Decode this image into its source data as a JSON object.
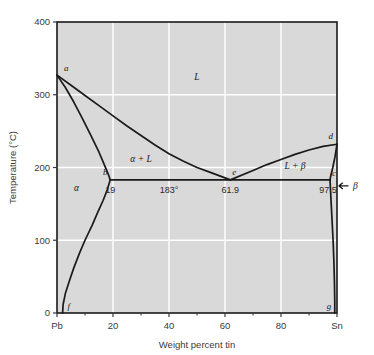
{
  "figure": {
    "background_color": "#d9d9d9",
    "gridline_color": "#ffffff",
    "line_color": "#1a1a1a",
    "frame_color": "#1a1a1a"
  },
  "axes": {
    "x_title": "Weight percent tin",
    "y_title": "Temperature (°C)",
    "x_ticks": [
      "Pb",
      "20",
      "40",
      "60",
      "80",
      "Sn"
    ],
    "x_tick_values": [
      0,
      20,
      40,
      60,
      80,
      100
    ],
    "x_minor_values": [
      10,
      30,
      50,
      70,
      90
    ],
    "y_ticks": [
      "0",
      "100",
      "200",
      "300",
      "400"
    ],
    "y_tick_values": [
      0,
      100,
      200,
      300,
      400
    ],
    "xlim": [
      0,
      100
    ],
    "ylim": [
      0,
      400
    ]
  },
  "point_labels": {
    "a": "a",
    "b": "b",
    "c": "c",
    "d": "d",
    "e": "e",
    "f": "f",
    "g": "g"
  },
  "region_labels": {
    "liquid": "L",
    "alpha": "α",
    "beta": "β",
    "alpha_plus_liquid": "α + L",
    "liquid_plus_beta": "L + β"
  },
  "value_labels": {
    "alpha_max": "19",
    "eutectic_temp": "183°",
    "eutectic_comp": "61.9",
    "beta_min": "97.5"
  },
  "chart_data": {
    "type": "line",
    "xlabel": "Weight percent tin",
    "ylabel": "Temperature (°C)",
    "xlim": [
      0,
      100
    ],
    "ylim": [
      0,
      400
    ],
    "grid": true,
    "legend": "none",
    "annotations": [
      {
        "label": "a",
        "x": 0,
        "y": 327,
        "note": "melting point of pure Pb"
      },
      {
        "label": "b",
        "x": 19,
        "y": 183,
        "note": "maximum solubility of Sn in alpha"
      },
      {
        "label": "c",
        "x": 97.5,
        "y": 183,
        "note": "maximum solubility of Pb in beta"
      },
      {
        "label": "d",
        "x": 100,
        "y": 232,
        "note": "melting point of pure Sn"
      },
      {
        "label": "e",
        "x": 61.9,
        "y": 183,
        "note": "eutectic point"
      },
      {
        "label": "f",
        "x": 2,
        "y": 0,
        "note": "solvus terminus on Pb side"
      },
      {
        "label": "g",
        "x": 99,
        "y": 0,
        "note": "solvus terminus on Sn side"
      },
      {
        "label": "19",
        "x": 19,
        "y": 170,
        "note": "composition value"
      },
      {
        "label": "183°",
        "x": 40,
        "y": 170,
        "note": "eutectic temperature"
      },
      {
        "label": "61.9",
        "x": 61.9,
        "y": 170,
        "note": "eutectic composition"
      },
      {
        "label": "97.5",
        "x": 97.5,
        "y": 170,
        "note": "composition value"
      }
    ],
    "series": [
      {
        "name": "liquidus (Pb side) a-e",
        "values": [
          [
            0,
            327
          ],
          [
            5,
            313
          ],
          [
            10,
            299
          ],
          [
            15,
            285
          ],
          [
            20,
            271
          ],
          [
            25,
            257
          ],
          [
            30,
            244
          ],
          [
            35,
            231
          ],
          [
            40,
            219
          ],
          [
            45,
            209
          ],
          [
            50,
            200
          ],
          [
            55,
            193
          ],
          [
            61.9,
            183
          ]
        ]
      },
      {
        "name": "liquidus (Sn side) e-d",
        "values": [
          [
            61.9,
            183
          ],
          [
            70,
            196
          ],
          [
            75,
            204
          ],
          [
            80,
            211
          ],
          [
            85,
            218
          ],
          [
            90,
            224
          ],
          [
            95,
            229
          ],
          [
            100,
            232
          ]
        ]
      },
      {
        "name": "solidus (Pb side) a-b",
        "values": [
          [
            0,
            327
          ],
          [
            3,
            310
          ],
          [
            6,
            290
          ],
          [
            9,
            268
          ],
          [
            12,
            245
          ],
          [
            15,
            221
          ],
          [
            17,
            203
          ],
          [
            18.3,
            191
          ],
          [
            19,
            183
          ]
        ]
      },
      {
        "name": "solidus (Sn side) d-c",
        "values": [
          [
            100,
            232
          ],
          [
            99.3,
            215
          ],
          [
            98.5,
            200
          ],
          [
            97.8,
            189
          ],
          [
            97.5,
            183
          ]
        ]
      },
      {
        "name": "eutectic isotherm b-e-c (183 degC)",
        "values": [
          [
            19,
            183
          ],
          [
            61.9,
            183
          ],
          [
            97.5,
            183
          ]
        ]
      },
      {
        "name": "solvus (Pb side) b-f",
        "values": [
          [
            19,
            183
          ],
          [
            18,
            170
          ],
          [
            16.5,
            155
          ],
          [
            14.5,
            138
          ],
          [
            12.5,
            120
          ],
          [
            10,
            100
          ],
          [
            8,
            82
          ],
          [
            6,
            62
          ],
          [
            4.5,
            45
          ],
          [
            3,
            27
          ],
          [
            2.2,
            12
          ],
          [
            2,
            0
          ]
        ]
      },
      {
        "name": "solvus (Sn side) c-g",
        "values": [
          [
            97.5,
            183
          ],
          [
            97.8,
            160
          ],
          [
            98.2,
            130
          ],
          [
            98.6,
            100
          ],
          [
            98.9,
            70
          ],
          [
            99.1,
            40
          ],
          [
            99.2,
            15
          ],
          [
            99.2,
            0
          ]
        ]
      }
    ],
    "phase_fields": [
      {
        "name": "L",
        "x": 50,
        "y": 320
      },
      {
        "name": "α",
        "x": 8,
        "y": 170
      },
      {
        "name": "β",
        "x": 100,
        "y": 165
      },
      {
        "name": "α + L",
        "x": 30,
        "y": 215
      },
      {
        "name": "L + β",
        "x": 86,
        "y": 200
      }
    ]
  }
}
